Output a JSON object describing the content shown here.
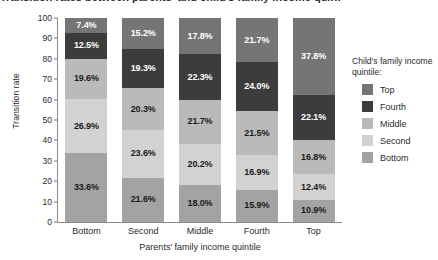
{
  "chart_data": {
    "type": "bar",
    "stacked": true,
    "stack_mode": "percent",
    "title": "Transition rates between parents' and child's family income quintile",
    "xlabel": "Parents' family income quintile",
    "ylabel": "Transition rate",
    "categories": [
      "Bottom",
      "Second",
      "Middle",
      "Fourth",
      "Top"
    ],
    "ylim": [
      0,
      100
    ],
    "yticks": [
      0,
      10,
      20,
      30,
      40,
      50,
      60,
      70,
      80,
      90,
      100
    ],
    "grid": false,
    "legend_position": "right",
    "legend_title": "Child's family income quintile:",
    "series_stack_order_bottom_to_top": [
      "Bottom",
      "Second",
      "Middle",
      "Fourth",
      "Top"
    ],
    "series": [
      {
        "name": "Top",
        "color": "#757575",
        "values": [
          7.4,
          15.2,
          17.8,
          21.7,
          37.8
        ],
        "labels": [
          "7.4%",
          "15.2%",
          "17.8%",
          "21.7%",
          "37.8%"
        ],
        "label_colors": [
          "#ffffff",
          "#ffffff",
          "#ffffff",
          "#ffffff",
          "#ffffff"
        ]
      },
      {
        "name": "Fourth",
        "color": "#3c3c3c",
        "values": [
          12.5,
          19.3,
          22.3,
          24.0,
          22.1
        ],
        "labels": [
          "12.5%",
          "19.3%",
          "22.3%",
          "24.0%",
          "22.1%"
        ],
        "label_colors": [
          "#ffffff",
          "#ffffff",
          "#ffffff",
          "#ffffff",
          "#ffffff"
        ]
      },
      {
        "name": "Middle",
        "color": "#bababa",
        "values": [
          19.6,
          20.3,
          21.7,
          21.5,
          16.8
        ],
        "labels": [
          "19.6%",
          "20.3%",
          "21.7%",
          "21.5%",
          "16.8%"
        ],
        "label_colors": [
          "#1a1a1a",
          "#1a1a1a",
          "#1a1a1a",
          "#1a1a1a",
          "#1a1a1a"
        ]
      },
      {
        "name": "Second",
        "color": "#d2d2d2",
        "values": [
          26.9,
          23.6,
          20.2,
          16.9,
          12.4
        ],
        "labels": [
          "26.9%",
          "23.6%",
          "20.2%",
          "16.9%",
          "12.4%"
        ],
        "label_colors": [
          "#1a1a1a",
          "#1a1a1a",
          "#1a1a1a",
          "#1a1a1a",
          "#1a1a1a"
        ]
      },
      {
        "name": "Bottom",
        "color": "#a3a3a3",
        "values": [
          33.6,
          21.6,
          18.0,
          15.9,
          10.9
        ],
        "labels": [
          "33.6%",
          "21.6%",
          "18.0%",
          "15.9%",
          "10.9%"
        ],
        "label_colors": [
          "#1a1a1a",
          "#1a1a1a",
          "#1a1a1a",
          "#1a1a1a",
          "#1a1a1a"
        ]
      }
    ],
    "legend_entries": [
      {
        "label": "Top",
        "color": "#757575"
      },
      {
        "label": "Fourth",
        "color": "#3c3c3c"
      },
      {
        "label": "Middle",
        "color": "#bababa"
      },
      {
        "label": "Second",
        "color": "#d2d2d2"
      },
      {
        "label": "Bottom",
        "color": "#a3a3a3"
      }
    ]
  }
}
